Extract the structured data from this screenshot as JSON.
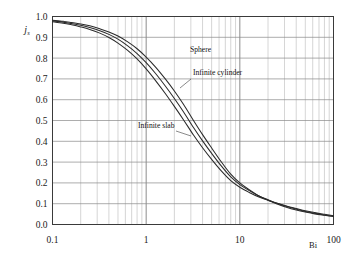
{
  "chart_data": {
    "type": "line",
    "title": "",
    "subtitle": "",
    "xlabel": "Bi",
    "ylabel": "j",
    "ylabel_sub": "s",
    "xscale": "log",
    "yscale": "linear",
    "xlim": [
      0.1,
      100
    ],
    "ylim": [
      0.0,
      1.0
    ],
    "grid": true,
    "grid_minor": true,
    "legend_position": "inline-labels",
    "xticks": [
      "0.1",
      "1",
      "10",
      "100"
    ],
    "xtick_values": [
      0.1,
      1,
      10,
      100
    ],
    "yticks": [
      "0.0",
      "0.1",
      "0.2",
      "0.3",
      "0.4",
      "0.5",
      "0.6",
      "0.7",
      "0.8",
      "0.9",
      "1.0"
    ],
    "ytick_values": [
      0.0,
      0.1,
      0.2,
      0.3,
      0.4,
      0.5,
      0.6,
      0.7,
      0.8,
      0.9,
      1.0
    ],
    "x": [
      0.1,
      0.13,
      0.16,
      0.2,
      0.25,
      0.32,
      0.4,
      0.5,
      0.63,
      0.8,
      1.0,
      1.26,
      1.6,
      2.0,
      2.5,
      3.2,
      4.0,
      5.0,
      6.3,
      8.0,
      10.0,
      12.6,
      16.0,
      20.0,
      25.0,
      32.0,
      40.0,
      50.0,
      63.0,
      80.0,
      100.0
    ],
    "series": [
      {
        "name": "Sphere",
        "label": "Sphere",
        "color": "#2b2b2b",
        "values": [
          0.982,
          0.977,
          0.971,
          0.964,
          0.955,
          0.941,
          0.926,
          0.906,
          0.879,
          0.845,
          0.805,
          0.757,
          0.7,
          0.642,
          0.578,
          0.5,
          0.432,
          0.368,
          0.303,
          0.242,
          0.2,
          0.167,
          0.137,
          0.117,
          0.099,
          0.082,
          0.07,
          0.06,
          0.051,
          0.044,
          0.038
        ]
      },
      {
        "name": "Infinite cylinder",
        "label": "Infinite cylinder",
        "color": "#2b2b2b",
        "values": [
          0.979,
          0.973,
          0.966,
          0.958,
          0.947,
          0.932,
          0.914,
          0.891,
          0.86,
          0.822,
          0.778,
          0.726,
          0.666,
          0.606,
          0.542,
          0.466,
          0.402,
          0.342,
          0.283,
          0.229,
          0.192,
          0.163,
          0.137,
          0.119,
          0.102,
          0.086,
          0.074,
          0.063,
          0.054,
          0.046,
          0.04
        ]
      },
      {
        "name": "Infinite slab",
        "label": "Infinite slab",
        "color": "#2b2b2b",
        "values": [
          0.975,
          0.968,
          0.96,
          0.95,
          0.938,
          0.92,
          0.899,
          0.872,
          0.838,
          0.796,
          0.748,
          0.692,
          0.63,
          0.568,
          0.504,
          0.43,
          0.369,
          0.313,
          0.259,
          0.211,
          0.179,
          0.154,
          0.132,
          0.117,
          0.102,
          0.088,
          0.077,
          0.066,
          0.057,
          0.049,
          0.042
        ]
      }
    ],
    "annotations": [
      {
        "text": "Sphere",
        "x": 190,
        "y": 52
      },
      {
        "text": "Infinite cylinder",
        "x": 193,
        "y": 75
      },
      {
        "text": "Infinite slab",
        "x": 138,
        "y": 128
      }
    ]
  }
}
